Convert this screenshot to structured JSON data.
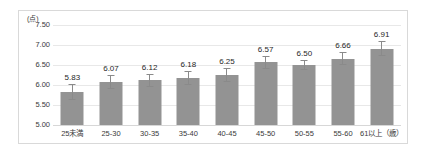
{
  "chart_data": {
    "type": "bar",
    "title": "",
    "subtitle": "",
    "xlabel": "",
    "ylabel": "",
    "unit_label": "(点)",
    "age_unit_suffix": "（歳）",
    "categories": [
      "25未満",
      "25-30",
      "30-35",
      "35-40",
      "40-45",
      "45-50",
      "50-55",
      "55-60",
      "61以上（歳）"
    ],
    "values": [
      5.83,
      6.07,
      6.12,
      6.18,
      6.25,
      6.57,
      6.5,
      6.66,
      6.91
    ],
    "value_labels": [
      "5.83",
      "6.07",
      "6.12",
      "6.18",
      "6.25",
      "6.57",
      "6.50",
      "6.66",
      "6.91"
    ],
    "errors": [
      0.2,
      0.17,
      0.16,
      0.17,
      0.17,
      0.16,
      0.13,
      0.16,
      0.19
    ],
    "ylim": [
      5.0,
      7.5
    ],
    "yticks": [
      7.5,
      7.0,
      6.5,
      6.0,
      5.5,
      5.0
    ],
    "ytick_labels": [
      "7.50",
      "7.00",
      "6.50",
      "6.00",
      "5.50",
      "5.00"
    ],
    "grid": true,
    "legend": false,
    "legend_position": "none",
    "bar_color": "#939393",
    "errorbar_color": "#8a8a8a",
    "gridline_color": "#e8e8e8",
    "frame_color": "#d9d9d9",
    "text_color": "#3a3a3a"
  }
}
